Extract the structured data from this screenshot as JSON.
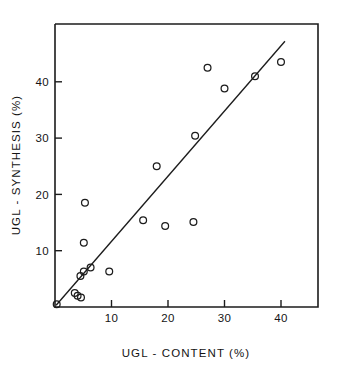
{
  "chart_data": {
    "type": "scatter",
    "title": "",
    "xlabel": "UGL - CONTENT  (%)",
    "ylabel": "UGL - SYNTHESIS  (%)",
    "xlim": [
      0,
      46.5
    ],
    "ylim": [
      0,
      50
    ],
    "grid": false,
    "legend": null,
    "x_ticks": [
      10,
      20,
      30,
      40
    ],
    "y_ticks": [
      10,
      20,
      30,
      40
    ],
    "x_tick_labels": [
      "10",
      "20",
      "30",
      "40"
    ],
    "y_tick_labels": [
      "10",
      "20",
      "30",
      "40"
    ],
    "marker": "open-circle",
    "series": [
      {
        "name": "samples",
        "points": [
          [
            0.3,
            0.5
          ],
          [
            3.5,
            2.5
          ],
          [
            4.0,
            2.0
          ],
          [
            4.6,
            1.7
          ],
          [
            4.5,
            5.5
          ],
          [
            5.1,
            6.3
          ],
          [
            6.3,
            7.0
          ],
          [
            5.1,
            11.4
          ],
          [
            5.3,
            18.5
          ],
          [
            9.6,
            6.3
          ],
          [
            15.6,
            15.4
          ],
          [
            18.0,
            25.0
          ],
          [
            19.5,
            14.4
          ],
          [
            24.5,
            15.1
          ],
          [
            24.8,
            30.4
          ],
          [
            27.0,
            42.5
          ],
          [
            30.0,
            38.8
          ],
          [
            35.4,
            41.0
          ],
          [
            40.0,
            43.5
          ]
        ]
      }
    ],
    "fit_line": {
      "name": "regression-line",
      "start": [
        0.2,
        0.3
      ],
      "end": [
        40.7,
        47.2
      ]
    }
  },
  "axes": {
    "x_axis_name": "UGL - CONTENT  (%)",
    "y_axis_name": "UGL - SYNTHESIS  (%)"
  }
}
